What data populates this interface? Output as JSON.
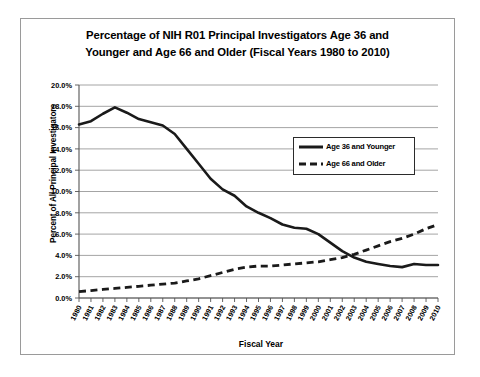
{
  "chart_data": {
    "type": "line",
    "title": "Percentage of NIH R01 Principal Investigators Age 36 and Younger and Age 66 and Older (Fiscal Years 1980 to 2010)",
    "title_line1": "Percentage of NIH R01 Principal Investigators Age 36 and",
    "title_line2": "Younger and Age 66 and Older (Fiscal Years 1980 to 2010)",
    "xlabel": "Fiscal Year",
    "ylabel": "Percent of All Principal Investigators",
    "ylim": [
      0,
      20
    ],
    "ytick_labels": [
      "0.0%",
      "2.0%",
      "4.0%",
      "6.0%",
      "8.0%",
      "10.0%",
      "12.0%",
      "14.0%",
      "16.0%",
      "18.0%",
      "20.0%"
    ],
    "ytick_values": [
      0,
      2,
      4,
      6,
      8,
      10,
      12,
      14,
      16,
      18,
      20
    ],
    "grid": true,
    "legend_position": "inside-upper-right",
    "categories": [
      "1980",
      "1981",
      "1982",
      "1983",
      "1984",
      "1985",
      "1986",
      "1987",
      "1988",
      "1989",
      "1990",
      "1991",
      "1992",
      "1993",
      "1994",
      "1995",
      "1996",
      "1997",
      "1998",
      "1999",
      "2000",
      "2001",
      "2002",
      "2003",
      "2004",
      "2005",
      "2006",
      "2007",
      "2008",
      "2009",
      "2010"
    ],
    "series": [
      {
        "name": "Age 36 and Younger",
        "style": "solid",
        "color": "#1a1a1a",
        "values": [
          16.3,
          16.6,
          17.3,
          17.9,
          17.4,
          16.8,
          16.5,
          16.2,
          15.4,
          14.0,
          12.6,
          11.2,
          10.2,
          9.6,
          8.6,
          8.0,
          7.5,
          6.9,
          6.6,
          6.5,
          6.0,
          5.2,
          4.4,
          3.8,
          3.4,
          3.2,
          3.0,
          2.9,
          3.2,
          3.1,
          3.1
        ]
      },
      {
        "name": "Age 66 and Older",
        "style": "dashed",
        "color": "#1a1a1a",
        "values": [
          0.6,
          0.7,
          0.8,
          0.9,
          1.0,
          1.1,
          1.2,
          1.3,
          1.4,
          1.6,
          1.8,
          2.1,
          2.4,
          2.7,
          2.9,
          3.0,
          3.0,
          3.1,
          3.2,
          3.3,
          3.4,
          3.6,
          3.8,
          4.1,
          4.5,
          4.9,
          5.3,
          5.6,
          6.0,
          6.5,
          6.9
        ]
      }
    ]
  },
  "legend": {
    "items": [
      {
        "label": "Age 36 and Younger",
        "style": "solid"
      },
      {
        "label": "Age 66 and Older",
        "style": "dashed"
      }
    ]
  }
}
